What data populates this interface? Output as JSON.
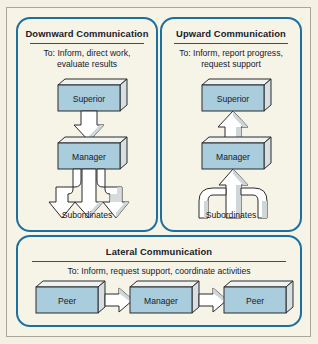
{
  "diagram": {
    "background_color": "#f4f1e4",
    "panel_border_color": "#1d6f9e",
    "box_fill_color": "#a9cddc",
    "box_outline_color": "#2b2b2b",
    "arrow_fill_color": "#ffffff",
    "panels": [
      {
        "id": "downward",
        "title": "Downward Communication",
        "subtitle": "To: Inform, direct work,\nevaluate results",
        "subtitle_line1": "To: Inform, direct work,",
        "subtitle_line2": "evaluate results",
        "nodes": [
          {
            "label": "Superior"
          },
          {
            "label": "Manager"
          }
        ],
        "foot_label": "Subordinates",
        "flow_direction": "down",
        "fanout_count": 3
      },
      {
        "id": "upward",
        "title": "Upward Communication",
        "subtitle_line1": "To: Inform, report progress,",
        "subtitle_line2": "request support",
        "nodes": [
          {
            "label": "Superior"
          },
          {
            "label": "Manager"
          }
        ],
        "foot_label": "Subordinates",
        "flow_direction": "up",
        "fanout_count": 3
      },
      {
        "id": "lateral",
        "title": "Lateral Communication",
        "subtitle_line1": "To: Inform, request support, coordinate activities",
        "nodes": [
          {
            "label": "Peer"
          },
          {
            "label": "Manager"
          },
          {
            "label": "Peer"
          }
        ],
        "flow_direction": "horizontal"
      }
    ]
  }
}
